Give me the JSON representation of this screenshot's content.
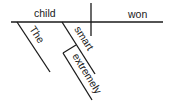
{
  "diagram": {
    "type": "sentence-diagram",
    "subject": "child",
    "predicate": "won",
    "modifiers": {
      "article": "The",
      "adjective": "smart",
      "adverb": "extremely"
    },
    "colors": {
      "line": "#1a1a1a",
      "background": "#ffffff"
    }
  }
}
